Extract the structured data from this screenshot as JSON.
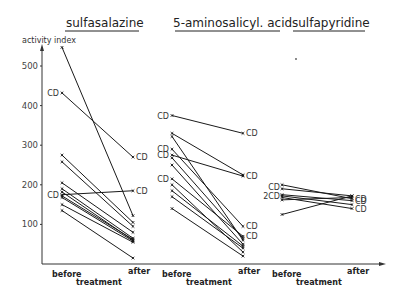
{
  "chart_data": {
    "type": "line",
    "title": "",
    "ylabel": "activity index",
    "ylim": [
      0,
      560
    ],
    "yticks": [
      100,
      200,
      300,
      400,
      500
    ],
    "grid": false,
    "legend": "none",
    "x_axis": {
      "tick_labels": [
        "before",
        "after"
      ],
      "label": "treatment"
    },
    "annotation_marker": "CD",
    "panels": [
      {
        "title": "sulfasalazine",
        "series": [
          {
            "before": 547,
            "after": 122,
            "cd_before": false,
            "cd_after": false
          },
          {
            "before": 432,
            "after": 270,
            "cd_before": true,
            "cd_after": true
          },
          {
            "before": 275,
            "after": 105,
            "cd_before": false,
            "cd_after": false
          },
          {
            "before": 258,
            "after": 95,
            "cd_before": false,
            "cd_after": false
          },
          {
            "before": 175,
            "after": 185,
            "cd_before": true,
            "cd_after": true
          },
          {
            "before": 205,
            "after": 80,
            "cd_before": false,
            "cd_after": false
          },
          {
            "before": 190,
            "after": 65,
            "cd_before": false,
            "cd_after": false
          },
          {
            "before": 182,
            "after": 60,
            "cd_before": false,
            "cd_after": false
          },
          {
            "before": 172,
            "after": 62,
            "cd_before": false,
            "cd_after": false
          },
          {
            "before": 168,
            "after": 58,
            "cd_before": false,
            "cd_after": false
          },
          {
            "before": 150,
            "after": 55,
            "cd_before": false,
            "cd_after": false
          },
          {
            "before": 135,
            "after": 15,
            "cd_before": false,
            "cd_after": false
          }
        ]
      },
      {
        "title": "5-aminosalicyl. acid",
        "series": [
          {
            "before": 375,
            "after": 330,
            "cd_before": true,
            "cd_after": true
          },
          {
            "before": 330,
            "after": 225,
            "cd_before": false,
            "cd_after": false
          },
          {
            "before": 322,
            "after": 60,
            "cd_before": false,
            "cd_after": false
          },
          {
            "before": 290,
            "after": 95,
            "cd_before": true,
            "cd_after": true
          },
          {
            "before": 275,
            "after": 222,
            "cd_before": true,
            "cd_after": true
          },
          {
            "before": 268,
            "after": 65,
            "cd_before": false,
            "cd_after": false
          },
          {
            "before": 215,
            "after": 70,
            "cd_before": true,
            "cd_after": true
          },
          {
            "before": 250,
            "after": 50,
            "cd_before": false,
            "cd_after": false
          },
          {
            "before": 200,
            "after": 30,
            "cd_before": false,
            "cd_after": false
          },
          {
            "before": 185,
            "after": 45,
            "cd_before": false,
            "cd_after": false
          },
          {
            "before": 170,
            "after": 40,
            "cd_before": false,
            "cd_after": false
          },
          {
            "before": 140,
            "after": 20,
            "cd_before": false,
            "cd_after": false
          }
        ]
      },
      {
        "title": "sulfapyridine",
        "series": [
          {
            "before": 200,
            "after": 165,
            "cd_before": false,
            "cd_after": true
          },
          {
            "before": 190,
            "after": 172,
            "cd_before": true,
            "cd_after": false
          },
          {
            "before": 175,
            "after": 160,
            "cd_before": true,
            "cd_after": true
          },
          {
            "before": 172,
            "after": 150,
            "cd_before": true,
            "cd_after": false
          },
          {
            "before": 168,
            "after": 140,
            "cd_before": false,
            "cd_after": true
          },
          {
            "before": 162,
            "after": 168,
            "cd_before": false,
            "cd_after": false
          },
          {
            "before": 125,
            "after": 172,
            "cd_before": false,
            "cd_after": false
          }
        ],
        "before_cd_labels": [
          "CD",
          "2CD"
        ]
      }
    ]
  },
  "labels": {
    "ylabel": "activity index",
    "yticks": [
      "100",
      "200",
      "300",
      "400",
      "500"
    ],
    "before": "before",
    "after": "after",
    "treatment": "treatment",
    "titles": [
      "sulfasalazine",
      "5-aminosalicyl. acid",
      "sulfapyridine"
    ]
  }
}
